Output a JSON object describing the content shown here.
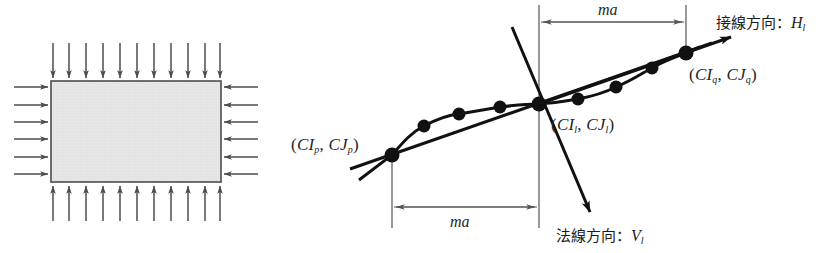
{
  "figure": {
    "panels": [
      {
        "id": "left-panel",
        "name": "uniform-pressure-rectangle",
        "description": "Rectangle with inward arrows on all four edges",
        "rect": {
          "x": 51,
          "y": 81,
          "width": 170,
          "height": 101,
          "fill": "#e6e6e6",
          "stroke": "#4d4d4d"
        },
        "arrows": {
          "top_count": 11,
          "bottom_count": 11,
          "left_count": 6,
          "right_count": 6,
          "length": 38,
          "color": "#4d4d4d",
          "direction": "inward"
        }
      },
      {
        "id": "right-panel",
        "name": "tangent-normal-diagram",
        "points": [
          {
            "name": "p",
            "label": "(CI_p, CJ_p)",
            "x": 392,
            "y": 155
          },
          {
            "name": "l",
            "label": "(CI_l, CJ_l)",
            "x": 539,
            "y": 104
          },
          {
            "name": "q",
            "label": "(CI_q, CJ_q)",
            "x": 686,
            "y": 53
          }
        ],
        "intermediate_nodes": [
          {
            "x": 424,
            "y": 126
          },
          {
            "x": 459,
            "y": 114
          },
          {
            "x": 500,
            "y": 107
          },
          {
            "x": 578,
            "y": 99
          },
          {
            "x": 616,
            "y": 87
          },
          {
            "x": 652,
            "y": 68
          }
        ],
        "color": "#111111"
      }
    ]
  },
  "labels": {
    "point_p": {
      "open": "(",
      "c1": "CI",
      "sub1": "p",
      "comma": ", ",
      "c2": "CJ",
      "sub2": "p",
      "close": ")",
      "text": "(CIp, CJp)"
    },
    "point_l": {
      "open": "(",
      "c1": "CI",
      "sub1": "l",
      "comma": ", ",
      "c2": "CJ",
      "sub2": "l",
      "close": ")",
      "text": "(CIl, CJl)"
    },
    "point_q": {
      "open": "(",
      "c1": "CI",
      "sub1": "q",
      "comma": ", ",
      "c2": "CJ",
      "sub2": "q",
      "close": ")",
      "text": "(CIq, CJq)"
    },
    "tangent_direction": {
      "jp": "接線方向：",
      "symbol": "H",
      "sub": "l",
      "text": "接線方向：Hl"
    },
    "normal_direction": {
      "jp": "法線方向：",
      "symbol": "V",
      "sub": "l",
      "text": "法線方向：Vl"
    },
    "dimension_top": "ma",
    "dimension_bottom": "ma"
  },
  "colors": {
    "curve": "#111111",
    "arrow": "#4d4d4d",
    "plate_fill": "#e6e6e6",
    "plate_stroke": "#4d4d4d",
    "dimension_line": "#555555",
    "text": "#262626",
    "background": "#ffffff"
  }
}
